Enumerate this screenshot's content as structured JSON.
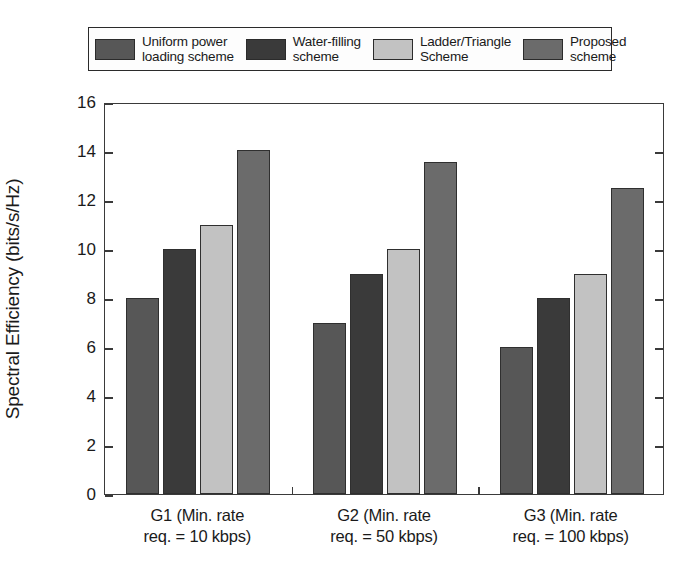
{
  "chart_data": {
    "type": "bar",
    "title": "",
    "xlabel": "",
    "ylabel": "Spectral Efficiency (bits/s/Hz)",
    "categories": [
      "G1 (Min. rate\nreq. = 10 kbps)",
      "G2 (Min. rate\nreq. = 50 kbps)",
      "G3 (Min. rate\nreq. = 100 kbps)"
    ],
    "series": [
      {
        "name": "Uniform power\nloading scheme",
        "values": [
          8.0,
          7.0,
          6.0
        ],
        "color": "#575757"
      },
      {
        "name": "Water-filling\nscheme",
        "values": [
          10.0,
          9.0,
          8.0
        ],
        "color": "#3a3a3a"
      },
      {
        "name": "Ladder/Triangle\nScheme",
        "values": [
          11.0,
          10.0,
          9.0
        ],
        "color": "#c2c2c2"
      },
      {
        "name": "Proposed\nscheme",
        "values": [
          14.05,
          13.55,
          12.5
        ],
        "color": "#6b6b6b"
      }
    ],
    "ylim": [
      0,
      16
    ],
    "yticks": [
      0,
      2,
      4,
      6,
      8,
      10,
      12,
      14,
      16
    ],
    "ytick_labels": [
      "0",
      "2",
      "4",
      "6",
      "8",
      "10",
      "12",
      "14",
      "16"
    ],
    "grid": false,
    "legend_position": "above-plot"
  }
}
